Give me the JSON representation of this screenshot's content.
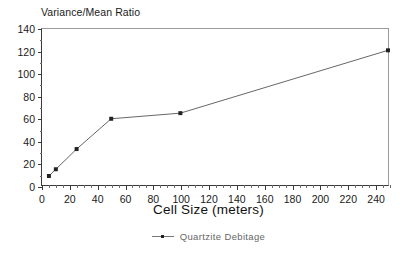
{
  "chart_data": {
    "type": "line",
    "title": "Variance/Mean Ratio",
    "xlabel": "Cell Size (meters)",
    "ylabel": "Variance/Mean Ratio",
    "xlim": [
      0,
      250
    ],
    "ylim": [
      0,
      140
    ],
    "grid": false,
    "legend_position": "bottom-center",
    "x_ticks": [
      0,
      20,
      40,
      60,
      80,
      100,
      120,
      140,
      160,
      180,
      200,
      220,
      240
    ],
    "x_tick_labels": [
      "0",
      "20",
      "40",
      "60",
      "80",
      "100",
      "120",
      "140",
      "160",
      "180",
      "200",
      "220",
      "240"
    ],
    "x_minor_tick_step": 5,
    "y_ticks": [
      0,
      20,
      40,
      60,
      80,
      100,
      120,
      140
    ],
    "y_tick_labels": [
      "0",
      "20",
      "40",
      "60",
      "80",
      "100",
      "120",
      "140"
    ],
    "y_minor_tick_step": 10,
    "series": [
      {
        "name": "Quartzite Debitage",
        "marker": "square",
        "color": "#555555",
        "marker_color": "#222222",
        "x": [
          5,
          10,
          25,
          50,
          100,
          250
        ],
        "values": [
          9,
          15,
          33,
          60,
          65,
          121
        ],
        "points": [
          {
            "x": 5,
            "y": 9
          },
          {
            "x": 10,
            "y": 15
          },
          {
            "x": 25,
            "y": 33
          },
          {
            "x": 50,
            "y": 60
          },
          {
            "x": 100,
            "y": 65
          },
          {
            "x": 250,
            "y": 121
          }
        ]
      }
    ]
  },
  "legend": {
    "entries": [
      {
        "label": "Quartzite Debitage"
      }
    ]
  },
  "colors": {
    "axis": "#3a3a3a",
    "frame": "#9a9a9a",
    "series_line": "#555555",
    "marker": "#222222",
    "text": "#1a1a1a",
    "legend_text": "#666666",
    "background": "#ffffff"
  }
}
